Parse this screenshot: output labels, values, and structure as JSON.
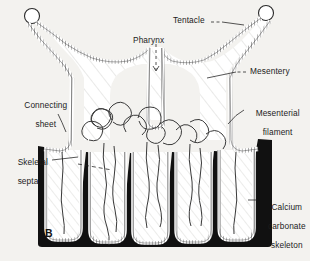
{
  "figure": {
    "panel_letter": "B",
    "background_color": "#f3f2ef",
    "ink_color": "#1c1c1c",
    "skeleton_color": "#111111"
  },
  "labels": {
    "tentacle": "Tentacle",
    "pharynx": "Pharynx",
    "mesentery": "Mesentery",
    "mesenterial_filament_line1": "Mesenterial",
    "mesenterial_filament_line2": "filament",
    "connecting_sheet_line1": "Connecting",
    "connecting_sheet_line2": "sheet",
    "skeletal_septa_line1": "Skeletal",
    "skeletal_septa_line2": "septa",
    "calcium_skeleton_line1": "Calcium",
    "calcium_skeleton_line2": "carbonate",
    "calcium_skeleton_line3": "skeleton"
  }
}
